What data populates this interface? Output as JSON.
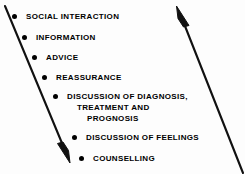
{
  "figure": {
    "background_color": "#fdfdfd",
    "ink_color": "#000000",
    "width": 245,
    "height": 174
  },
  "arrows": [
    {
      "name": "left-downward-arrow",
      "direction": "down-right",
      "from": [
        5,
        6
      ],
      "to": [
        70,
        162
      ]
    },
    {
      "name": "right-upward-arrow",
      "direction": "up-left",
      "from": [
        243,
        172
      ],
      "to": [
        177,
        7
      ]
    }
  ],
  "items": [
    {
      "bullet": "filled-circle",
      "lines": [
        "SOCIAL INTERACTION"
      ],
      "x": 12,
      "y": 11
    },
    {
      "bullet": "filled-circle",
      "lines": [
        "INFORMATION"
      ],
      "x": 22,
      "y": 32
    },
    {
      "bullet": "filled-circle",
      "lines": [
        "ADVICE"
      ],
      "x": 32,
      "y": 52
    },
    {
      "bullet": "filled-circle",
      "lines": [
        "REASSURANCE"
      ],
      "x": 42,
      "y": 72
    },
    {
      "bullet": "filled-circle",
      "lines": [
        "DISCUSSION OF DIAGNOSIS,",
        "TREATMENT AND",
        "PROGNOSIS"
      ],
      "x": 53,
      "y": 91
    },
    {
      "bullet": "filled-circle",
      "lines": [
        "DISCUSSION OF FEELINGS"
      ],
      "x": 72,
      "y": 132
    },
    {
      "bullet": "filled-circle",
      "lines": [
        "COUNSELLING"
      ],
      "x": 79,
      "y": 153
    }
  ]
}
